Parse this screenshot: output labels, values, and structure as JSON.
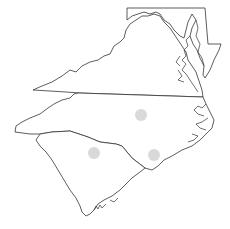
{
  "map": {
    "regions": [
      {
        "id": "maryland",
        "label": "Maryland"
      },
      {
        "id": "virginia",
        "label": "Virginia"
      },
      {
        "id": "north-carolina",
        "label": "North Carolina"
      },
      {
        "id": "south-carolina",
        "label": "South Carolina"
      }
    ],
    "markers": [
      {
        "id": "marker-nc-central",
        "cx": 141,
        "cy": 115,
        "r": 6,
        "color": "#d9d9d9"
      },
      {
        "id": "marker-sc-central",
        "cx": 94,
        "cy": 153,
        "r": 6,
        "color": "#d9d9d9"
      },
      {
        "id": "marker-nc-southeast",
        "cx": 154,
        "cy": 155,
        "r": 6,
        "color": "#d9d9d9"
      }
    ],
    "colors": {
      "background": "#ffffff",
      "outline": "#333333",
      "marker": "#d9d9d9"
    }
  }
}
